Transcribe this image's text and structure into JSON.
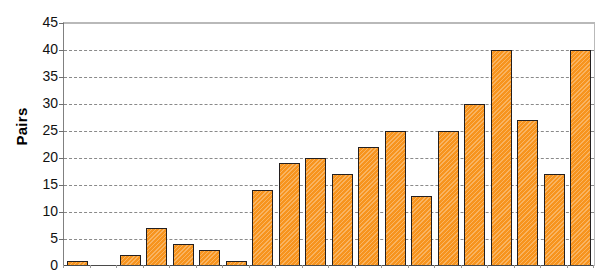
{
  "chart_data": {
    "type": "bar",
    "title": "",
    "xlabel": "",
    "ylabel": "Pairs",
    "ylim": [
      0,
      45
    ],
    "ytick_labels": [
      "45",
      "40",
      "35",
      "30",
      "25",
      "20",
      "15",
      "10",
      "5",
      "0"
    ],
    "ytick_values": [
      45,
      40,
      35,
      30,
      25,
      20,
      15,
      10,
      5,
      0
    ],
    "grid": true,
    "legend": "none",
    "categories": [
      "1",
      "2",
      "3",
      "4",
      "5",
      "6",
      "7",
      "8",
      "9",
      "10",
      "11",
      "12",
      "13",
      "14",
      "15",
      "16",
      "17",
      "18",
      "19",
      "20"
    ],
    "values": [
      1,
      0,
      2,
      7,
      4,
      3,
      1,
      14,
      19,
      20,
      17,
      22,
      25,
      13,
      25,
      30,
      40,
      27,
      17,
      40
    ],
    "bar_color": "#F7941E",
    "bar_edge_color": "#231F20",
    "gridline_color": "#8A8A8A",
    "axis_color": "#808080",
    "background": "#FFFFFF"
  },
  "axis": {
    "y_label": "Pairs"
  }
}
